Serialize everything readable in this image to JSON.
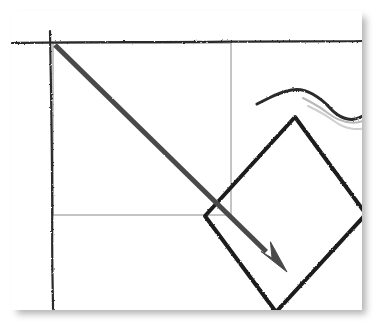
{
  "domain_note": "hand-drawn sketch diagram on white panel",
  "panel": {
    "background_color": "#ffffff",
    "shadow_color": "#b4b4b4",
    "bounds": {
      "x": 11,
      "y": 11,
      "width": 351,
      "height": 299
    }
  },
  "palette": {
    "ink_dark": "#2b2b2b",
    "ink_black": "#1c1c1c",
    "thin_gray": "#8a8a8a",
    "wave_light_1": "#b9b9b9",
    "wave_light_2": "#cfcfcf",
    "arrow_fill": "#4a4a4a",
    "background": "#ffffff"
  },
  "figure": {
    "type": "sketch-diagram",
    "title": "",
    "elements": [
      {
        "name": "axis-horizontal-rule",
        "kind": "hand-drawn-line",
        "color": "#2b2b2b",
        "stroke_width": 2.2,
        "from": {
          "x": 12,
          "y": 43
        },
        "to": {
          "x": 362,
          "y": 41
        }
      },
      {
        "name": "axis-vertical-rule",
        "kind": "hand-drawn-line",
        "color": "#2b2b2b",
        "stroke_width": 2.2,
        "from": {
          "x": 50,
          "y": 31
        },
        "to": {
          "x": 53,
          "y": 309
        }
      },
      {
        "name": "inner-rectangle",
        "kind": "thin-rectangle-outline",
        "color": "#8a8a8a",
        "stroke_width": 1,
        "x": 53,
        "y": 43,
        "width": 178,
        "height": 172
      },
      {
        "name": "arrow-diagonal-down-right",
        "kind": "thick-arrow",
        "color": "#4a4a4a",
        "stroke_width": 5,
        "from": {
          "x": 55,
          "y": 45
        },
        "to": {
          "x": 287,
          "y": 272
        },
        "head_length": 33,
        "head_half_width": 10
      },
      {
        "name": "diamond-outline",
        "kind": "rotated-square-outline",
        "color": "#1c1c1c",
        "stroke_width": 4,
        "vertices": [
          {
            "x": 295,
            "y": 117
          },
          {
            "x": 366,
            "y": 214
          },
          {
            "x": 276,
            "y": 312
          },
          {
            "x": 205,
            "y": 216
          }
        ]
      },
      {
        "name": "wave-curve-dark",
        "kind": "hand-drawn-curve",
        "color": "#2b2b2b",
        "stroke_width": 3,
        "points": [
          {
            "x": 257,
            "y": 104
          },
          {
            "x": 281,
            "y": 92
          },
          {
            "x": 302,
            "y": 88
          },
          {
            "x": 323,
            "y": 100
          },
          {
            "x": 336,
            "y": 115
          },
          {
            "x": 352,
            "y": 121
          },
          {
            "x": 367,
            "y": 114
          }
        ]
      },
      {
        "name": "wave-curve-light-upper",
        "kind": "hand-drawn-curve",
        "color": "#b9b9b9",
        "stroke_width": 2,
        "points": [
          {
            "x": 303,
            "y": 98
          },
          {
            "x": 320,
            "y": 107
          },
          {
            "x": 337,
            "y": 120
          },
          {
            "x": 356,
            "y": 124
          },
          {
            "x": 370,
            "y": 118
          }
        ]
      },
      {
        "name": "wave-curve-light-lower",
        "kind": "hand-drawn-curve",
        "color": "#cfcfcf",
        "stroke_width": 2,
        "points": [
          {
            "x": 308,
            "y": 106
          },
          {
            "x": 326,
            "y": 115
          },
          {
            "x": 342,
            "y": 127
          },
          {
            "x": 360,
            "y": 130
          },
          {
            "x": 372,
            "y": 125
          }
        ]
      }
    ]
  }
}
